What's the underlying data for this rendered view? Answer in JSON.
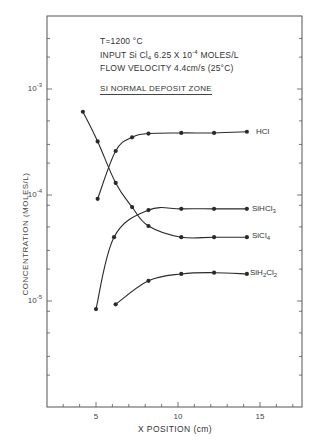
{
  "chart_data": {
    "type": "line",
    "title": "",
    "annotations": {
      "conditions": [
        "T=1200 °C",
        "INPUT Si Cl4  6.25 X 10^-4 MOLES/L",
        "FLOW VELOCITY 4.4cm/s (25°C)"
      ],
      "zone_label": "SI NORMAL DEPOSIT ZONE"
    },
    "xlabel": "X  POSITION (cm)",
    "ylabel": "CONCENTRATION (MOLES/L)",
    "xlim": [
      2,
      17.5
    ],
    "ylim": [
      1e-06,
      0.003
    ],
    "yscale": "log",
    "x_ticks": [
      5,
      10,
      15
    ],
    "x_tick_labels": [
      "5",
      "10",
      "15"
    ],
    "y_ticks": [
      0.001,
      0.0001,
      1e-05
    ],
    "y_tick_labels": [
      "10^-3",
      "10^-4",
      "10^-5"
    ],
    "grid": false,
    "legend": "inline labels at right end of each series",
    "series": [
      {
        "name": "HCl",
        "x": [
          5.1,
          6.2,
          7.2,
          8.2,
          10.2,
          12.2,
          14.2
        ],
        "values": [
          9.2e-05,
          0.00026,
          0.00035,
          0.00038,
          0.000385,
          0.000385,
          0.000395
        ]
      },
      {
        "name": "SiHCl3",
        "x": [
          5.0,
          6.1,
          8.2,
          10.2,
          12.2,
          14.2
        ],
        "values": [
          8.4e-06,
          4e-05,
          7.2e-05,
          7.4e-05,
          7.4e-05,
          7.4e-05
        ]
      },
      {
        "name": "SiCl4",
        "x": [
          4.2,
          5.1,
          6.2,
          7.2,
          8.2,
          10.2,
          12.2,
          14.2
        ],
        "values": [
          0.00061,
          0.00032,
          0.00013,
          7.7e-05,
          5.1e-05,
          4e-05,
          4e-05,
          4e-05
        ]
      },
      {
        "name": "SiH2Cl2",
        "x": [
          6.2,
          8.2,
          10.2,
          12.2,
          14.2
        ],
        "values": [
          9.3e-06,
          1.55e-05,
          1.8e-05,
          1.85e-05,
          1.8e-05
        ]
      }
    ]
  },
  "labels": {
    "cond_line1": "T=1200 °C",
    "cond_line2_pre": "INPUT Si Cl",
    "cond_line2_sub": "4",
    "cond_line2_mid": "  6.25 X 10",
    "cond_line2_sup": "-4",
    "cond_line2_post": " MOLES/L",
    "cond_line3": "FLOW VELOCITY 4.4cm/s (25°C)",
    "zone": "SI NORMAL DEPOSIT ZONE",
    "xlabel": "X  POSITION (cm)",
    "ylabel": "CONCENTRATION (MOLES/L)",
    "ytick_base": "10",
    "ytick_exp": [
      "-3",
      "-4",
      "-5"
    ],
    "xticks": [
      "5",
      "10",
      "15"
    ],
    "series": {
      "hcl": "HCl",
      "sihcl3_pre": "SiHCl",
      "sihcl3_sub": "3",
      "sicl4_pre": "SiCl",
      "sicl4_sub": "4",
      "sih2cl2_a": "SiH",
      "sih2cl2_sub1": "2",
      "sih2cl2_b": "Cl",
      "sih2cl2_sub2": "2"
    }
  },
  "colors": {
    "ink": "#2a2a2a",
    "frame": "#555555",
    "background": "#ffffff"
  }
}
